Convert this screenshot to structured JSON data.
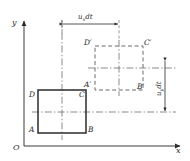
{
  "figure": {
    "type": "fluid-element-deformation-diagram",
    "axes": {
      "y_label": "y",
      "x_label": "x",
      "origin_label": "O"
    },
    "original_square": {
      "name": "ABCD",
      "vertices": [
        {
          "id": "A",
          "label": "A",
          "position": "bottom-left"
        },
        {
          "id": "B",
          "label": "B",
          "position": "bottom-right"
        },
        {
          "id": "C",
          "label": "C",
          "position": "top-right"
        },
        {
          "id": "D",
          "label": "D",
          "position": "top-left"
        }
      ],
      "style": "solid"
    },
    "displaced_square": {
      "name": "A'B'C'D'",
      "vertices": [
        {
          "id": "Ap",
          "label": "A′",
          "position": "bottom-left"
        },
        {
          "id": "Bp",
          "label": "B′",
          "position": "bottom-right"
        },
        {
          "id": "Cp",
          "label": "C′",
          "position": "top-right"
        },
        {
          "id": "Dp",
          "label": "D′",
          "position": "top-left"
        }
      ],
      "style": "dashed"
    },
    "dimensions": [
      {
        "id": "horizontal-displacement",
        "symbol": "u",
        "subscript": "x",
        "differential": "dt",
        "text": "uₓdt",
        "orientation": "horizontal",
        "arrow": "double"
      },
      {
        "id": "vertical-displacement",
        "symbol": "u",
        "subscript": "y",
        "differential": "dt",
        "text": "uᵧdt",
        "orientation": "vertical",
        "arrow": "double"
      }
    ],
    "colors": {
      "line": "#2b2b2b",
      "thin_line": "#555555",
      "background": "#ffffff"
    }
  }
}
